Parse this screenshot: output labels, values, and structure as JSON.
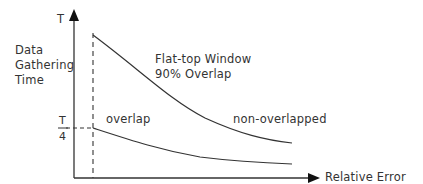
{
  "diagram": {
    "y_axis": {
      "top_label": "T",
      "title_lines": [
        "Data",
        "Gathering",
        "Time"
      ],
      "tick_label_numerator": "T",
      "tick_label_denominator": "4"
    },
    "x_axis": {
      "title": "Relative Error"
    },
    "annotations": {
      "window_line1": "Flat-top Window",
      "window_line2": "90% Overlap",
      "overlap": "overlap",
      "non_overlapped": "non-overlapped"
    },
    "curves": [
      {
        "name": "non-overlapped",
        "start": "T",
        "shape": "decaying"
      },
      {
        "name": "overlap",
        "start": "T/4",
        "shape": "decaying"
      }
    ],
    "colors": {
      "line": "#333333",
      "background": "#ffffff"
    }
  }
}
